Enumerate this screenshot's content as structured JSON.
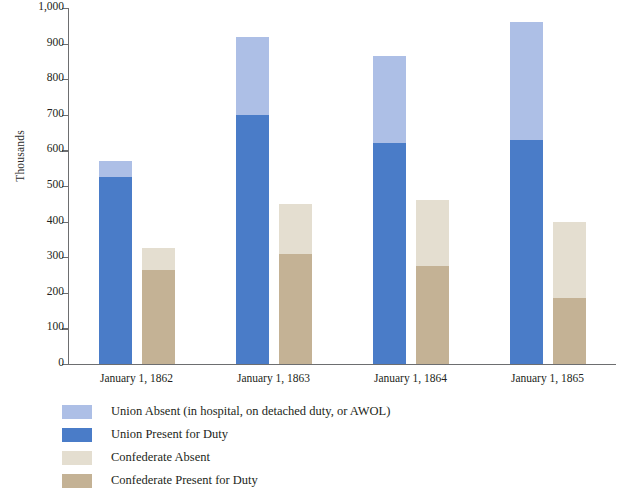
{
  "chart_data": {
    "type": "bar",
    "stacked": true,
    "grouped": true,
    "title": "",
    "xlabel": "",
    "ylabel": "Thousands",
    "categories": [
      "January 1, 1862",
      "January 1, 1863",
      "January 1, 1864",
      "January 1, 1865"
    ],
    "ylim": [
      0,
      1000
    ],
    "yticks": [
      0,
      100,
      200,
      300,
      400,
      500,
      600,
      700,
      800,
      900,
      1000
    ],
    "ytick_labels": [
      "0",
      "100",
      "200",
      "300",
      "400",
      "500",
      "600",
      "700",
      "800",
      "900",
      "1,000"
    ],
    "grid": false,
    "legend_position": "bottom-left",
    "groups": [
      {
        "name": "Union",
        "series": [
          {
            "name": "Union Present for Duty",
            "color": "#4a7cc8",
            "values": [
              525,
              700,
              620,
              630
            ]
          },
          {
            "name": "Union Absent (in hospital, on detached duty, or AWOL)",
            "color": "#adbfe6",
            "values": [
              45,
              220,
              245,
              330
            ]
          }
        ],
        "totals": [
          570,
          920,
          865,
          960
        ]
      },
      {
        "name": "Confederate",
        "series": [
          {
            "name": "Confederate Present for Duty",
            "color": "#c4b295",
            "values": [
              265,
              310,
              275,
              185
            ]
          },
          {
            "name": "Confederate Absent",
            "color": "#e4ded0",
            "values": [
              60,
              140,
              185,
              215
            ]
          }
        ],
        "totals": [
          325,
          450,
          460,
          400
        ]
      }
    ],
    "legend": [
      {
        "label": "Union Absent (in hospital, on detached duty, or AWOL)",
        "color": "#adbfe6"
      },
      {
        "label": "Union Present for Duty",
        "color": "#4a7cc8"
      },
      {
        "label": "Confederate Absent",
        "color": "#e4ded0"
      },
      {
        "label": "Confederate Present for Duty",
        "color": "#c4b295"
      }
    ],
    "colors": {
      "union_absent": "#adbfe6",
      "union_present": "#4a7cc8",
      "confederate_absent": "#e4ded0",
      "confederate_present": "#c4b295",
      "axis": "#6d6e70",
      "text": "#231f20"
    }
  }
}
